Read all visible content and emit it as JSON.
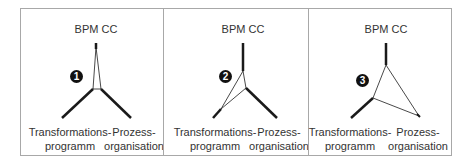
{
  "diagram": {
    "panels": [
      {
        "number": "1",
        "top_label": "BPM CC",
        "left_label": "Transformations-\nprogramm",
        "right_label": "Prozess-\norganisation"
      },
      {
        "number": "2",
        "top_label": "BPM CC",
        "left_label": "Transformations-\nprogramm",
        "right_label": "Prozess-\norganisation"
      },
      {
        "number": "3",
        "top_label": "BPM CC",
        "left_label": "Transformations-\nprogramm",
        "right_label": "Prozess-\norganisation"
      }
    ],
    "colors": {
      "line": "#1a1a1a",
      "border": "#a8a8a8",
      "text": "#333333",
      "badge": "#111111"
    }
  }
}
